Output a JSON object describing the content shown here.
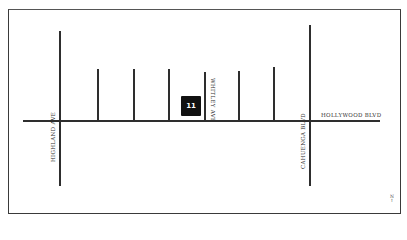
{
  "map": {
    "colors": {
      "road": "#2e2e2e",
      "marker_bg": "#111111",
      "marker_text": "#ffffff",
      "background": "#ffffff"
    },
    "marker": {
      "label": "11",
      "icon": "location-marker-icon"
    },
    "streets": {
      "main_boulevard": "HOLLYWOOD BLVD",
      "west_avenue": "HIGHLAND AVE",
      "east_boulevard": "CAHUENGA BLVD",
      "side_street_labeled": "WHITLEY AVE"
    },
    "compass": {
      "letter": "N",
      "arrow": "↑",
      "icon": "north-arrow-icon"
    }
  }
}
